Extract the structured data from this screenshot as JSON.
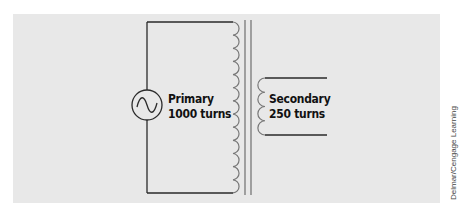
{
  "diagram": {
    "source": {
      "symbol": "ac-source-icon"
    },
    "primary": {
      "name": "Primary",
      "turns_label": "1000 turns",
      "turns": 1000
    },
    "secondary": {
      "name": "Secondary",
      "turns_label": "250 turns",
      "turns": 250
    },
    "colors": {
      "panel": "#e8e8e8",
      "lines": "#2a2a2a",
      "core": "#777777",
      "text": "#111111"
    }
  },
  "credit": "Delmar/Cengage Learning"
}
